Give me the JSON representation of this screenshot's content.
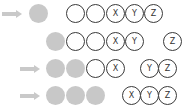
{
  "colors": {
    "arrow": "#c9c9c9",
    "filled": "#c8c8c8",
    "outline": "#3a3a3a"
  },
  "rows": [
    {
      "arrow": true,
      "filled": 1,
      "empty_unlabeled": 2,
      "labels": [
        "X",
        "Y",
        "Z"
      ]
    },
    {
      "arrow": false,
      "filled": 1,
      "empty_unlabeled": 2,
      "labels": [
        "X",
        "Y",
        "Z"
      ]
    },
    {
      "arrow": true,
      "filled": 2,
      "empty_unlabeled": 1,
      "labels": [
        "X",
        "Y",
        "Z"
      ]
    },
    {
      "arrow": true,
      "filled": 3,
      "empty_unlabeled": 0,
      "labels": [
        "X",
        "Y",
        "Z"
      ]
    }
  ]
}
